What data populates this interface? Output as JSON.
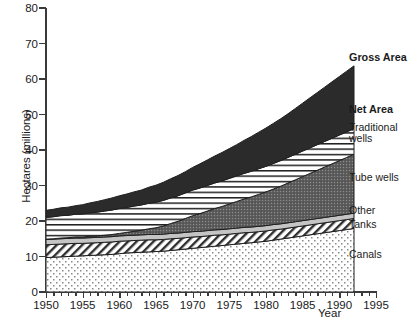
{
  "chart_data": {
    "type": "area",
    "subtype": "stacked-area",
    "title": "",
    "xlabel": "Year",
    "ylabel": "Hectares (millions)",
    "xlim": [
      1950,
      1995
    ],
    "ylim": [
      0,
      80
    ],
    "ytick_labels": [
      "0",
      "10",
      "20",
      "30",
      "40",
      "50",
      "60",
      "70",
      "80"
    ],
    "ytick_values": [
      0,
      10,
      20,
      30,
      40,
      50,
      60,
      70,
      80
    ],
    "ytick_interval": 10,
    "xtick_labels": [
      "1950",
      "1955",
      "1960",
      "1965",
      "1970",
      "1975",
      "1980",
      "1985",
      "1990",
      "1995"
    ],
    "xtick_values": [
      1950,
      1955,
      1960,
      1965,
      1970,
      1975,
      1980,
      1985,
      1990,
      1995
    ],
    "xtick_minor_interval": 1,
    "grid": false,
    "legend_position": "right-inline",
    "x": [
      1950,
      1951,
      1952,
      1953,
      1954,
      1955,
      1956,
      1957,
      1958,
      1959,
      1960,
      1961,
      1962,
      1963,
      1964,
      1965,
      1966,
      1967,
      1968,
      1969,
      1970,
      1971,
      1972,
      1973,
      1974,
      1975,
      1976,
      1977,
      1978,
      1979,
      1980,
      1981,
      1982,
      1983,
      1984,
      1985,
      1986,
      1987,
      1988,
      1989,
      1990,
      1991,
      1992
    ],
    "series": [
      {
        "name": "Canals",
        "pattern": "dotted",
        "color": "#fdfdfd",
        "values": [
          9.7,
          9.8,
          9.9,
          10.0,
          10.1,
          10.2,
          10.3,
          10.4,
          10.5,
          10.6,
          10.8,
          11.0,
          11.1,
          11.2,
          11.3,
          11.4,
          11.5,
          11.7,
          11.9,
          12.1,
          12.3,
          12.5,
          12.7,
          12.9,
          13.1,
          13.3,
          13.5,
          13.7,
          13.9,
          14.1,
          14.3,
          14.6,
          14.9,
          15.2,
          15.5,
          15.8,
          16.1,
          16.4,
          16.7,
          17.0,
          17.3,
          17.6,
          17.9
        ]
      },
      {
        "name": "Tanks",
        "pattern": "diagonal-hatch",
        "color": "#ffffff",
        "values": [
          3.6,
          3.6,
          3.6,
          3.6,
          3.6,
          3.5,
          3.5,
          3.5,
          3.5,
          3.5,
          3.5,
          3.4,
          3.4,
          3.4,
          3.4,
          3.3,
          3.3,
          3.3,
          3.2,
          3.2,
          3.2,
          3.1,
          3.1,
          3.1,
          3.0,
          3.0,
          3.0,
          3.0,
          2.9,
          2.9,
          2.9,
          2.9,
          2.8,
          2.8,
          2.8,
          2.8,
          2.8,
          2.8,
          2.8,
          2.8,
          2.8,
          2.8,
          2.8
        ]
      },
      {
        "name": "Other",
        "pattern": "solid-light-gray",
        "color": "#c9c9c9",
        "values": [
          1.5,
          1.5,
          1.5,
          1.5,
          1.5,
          1.5,
          1.5,
          1.5,
          1.5,
          1.5,
          1.5,
          1.5,
          1.5,
          1.5,
          1.5,
          1.5,
          1.5,
          1.5,
          1.5,
          1.5,
          1.5,
          1.5,
          1.5,
          1.5,
          1.5,
          1.5,
          1.5,
          1.5,
          1.5,
          1.5,
          1.5,
          1.5,
          1.5,
          1.5,
          1.5,
          1.5,
          1.5,
          1.5,
          1.5,
          1.5,
          1.5,
          1.5,
          1.5
        ]
      },
      {
        "name": "Tube wells",
        "pattern": "dark-gray-stipple",
        "color": "#6e6e6e",
        "values": [
          0.1,
          0.1,
          0.2,
          0.2,
          0.3,
          0.3,
          0.4,
          0.4,
          0.5,
          0.6,
          0.7,
          0.9,
          1.1,
          1.3,
          1.6,
          1.9,
          2.3,
          2.8,
          3.3,
          3.9,
          4.5,
          5.0,
          5.5,
          6.0,
          6.5,
          7.0,
          7.5,
          8.0,
          8.5,
          9.0,
          9.5,
          10.0,
          10.6,
          11.2,
          11.8,
          12.4,
          13.0,
          13.6,
          14.2,
          14.8,
          15.4,
          16.0,
          16.6
        ]
      },
      {
        "name": "Traditional wells",
        "pattern": "horizontal-lines",
        "color": "#ffffff",
        "values": [
          6.1,
          6.2,
          6.3,
          6.3,
          6.4,
          6.5,
          6.6,
          6.7,
          6.8,
          6.9,
          7.0,
          7.0,
          7.1,
          7.1,
          7.2,
          7.2,
          7.2,
          7.2,
          7.2,
          7.2,
          7.2,
          7.2,
          7.2,
          7.2,
          7.2,
          7.2,
          7.2,
          7.2,
          7.2,
          7.2,
          7.2,
          7.2,
          7.2,
          7.2,
          7.2,
          7.2,
          7.2,
          7.2,
          7.2,
          7.2,
          7.2,
          7.2,
          7.2
        ]
      },
      {
        "name": "Gross minus Net",
        "pattern": "solid-black",
        "color": "#2b2b2b",
        "values": [
          2.0,
          2.1,
          2.2,
          2.3,
          2.4,
          2.6,
          2.8,
          3.0,
          3.2,
          3.4,
          3.6,
          3.8,
          4.0,
          4.2,
          4.5,
          4.8,
          5.1,
          5.4,
          5.7,
          6.0,
          6.4,
          6.8,
          7.2,
          7.6,
          8.0,
          8.4,
          8.8,
          9.3,
          9.8,
          10.3,
          10.8,
          11.3,
          11.8,
          12.3,
          12.9,
          13.5,
          14.1,
          14.7,
          15.3,
          15.9,
          16.5,
          17.1,
          17.7
        ]
      }
    ],
    "cumulative_boundaries": {
      "net_area_1950": 21.0,
      "net_area_1992": 44.0,
      "gross_area_1950": 23.0,
      "gross_area_1992": 61.7
    },
    "annotations": [
      {
        "label": "Gross Area",
        "bold": true
      },
      {
        "label": "Net Area",
        "bold": true
      },
      {
        "label": "Traditional wells",
        "bold": false
      },
      {
        "label": "Tube wells",
        "bold": false
      },
      {
        "label": "Other",
        "bold": false
      },
      {
        "label": "Tanks",
        "bold": false
      },
      {
        "label": "Canals",
        "bold": false
      }
    ]
  },
  "axes": {
    "ylabel": "Hectares (millions)",
    "xlabel": "Year",
    "yticks": [
      "80",
      "70",
      "60",
      "50",
      "40",
      "30",
      "20",
      "10",
      "0"
    ],
    "xticks": [
      "1950",
      "1955",
      "1960",
      "1965",
      "1970",
      "1975",
      "1980",
      "1985",
      "1990",
      "1995"
    ]
  },
  "legend": {
    "gross_area": "Gross Area",
    "net_area": "Net Area",
    "traditional_wells_line1": "Traditional",
    "traditional_wells_line2": "wells",
    "tube_wells": "Tube wells",
    "other": "Other",
    "tanks": "Tanks",
    "canals": "Canals"
  }
}
